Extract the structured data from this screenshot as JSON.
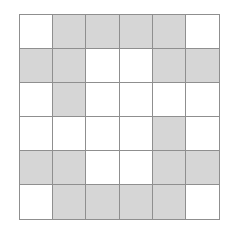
{
  "diagram": {
    "type": "grid",
    "rows": 6,
    "cols": 6,
    "colors": {
      "filled": "#d6d6d6",
      "empty": "#ffffff",
      "line": "#8f8f8f"
    },
    "cells": [
      [
        0,
        1,
        1,
        1,
        1,
        0
      ],
      [
        1,
        1,
        0,
        0,
        1,
        1
      ],
      [
        0,
        1,
        0,
        0,
        0,
        0
      ],
      [
        0,
        0,
        0,
        0,
        1,
        0
      ],
      [
        1,
        1,
        0,
        0,
        1,
        1
      ],
      [
        0,
        1,
        1,
        1,
        1,
        0
      ]
    ]
  }
}
